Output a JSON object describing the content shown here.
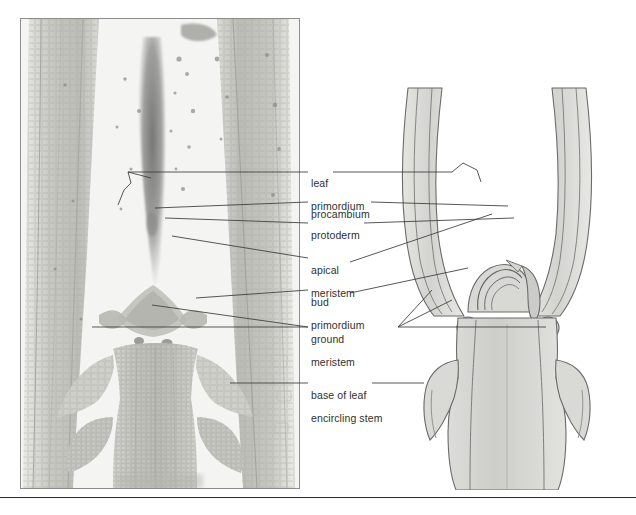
{
  "figure": {
    "panels": {
      "micrograph": {
        "name": "light micrograph of shoot apex",
        "kind": "photomicrograph",
        "tone": "grayscale"
      },
      "drawing": {
        "name": "interpretive line drawing of shoot apex",
        "kind": "line-drawing",
        "tone": "grayscale"
      }
    }
  },
  "labels": [
    {
      "id": "leaf-primordium",
      "line1": "leaf",
      "line2": "primordium"
    },
    {
      "id": "procambium",
      "line1": "procambium",
      "line2": ""
    },
    {
      "id": "protoderm",
      "line1": "protoderm",
      "line2": ""
    },
    {
      "id": "apical-meristem",
      "line1": "apical",
      "line2": "meristem"
    },
    {
      "id": "bud-primordium",
      "line1": "bud",
      "line2": "primordium"
    },
    {
      "id": "ground-meristem",
      "line1": "ground",
      "line2": "meristem"
    },
    {
      "id": "base-of-leaf",
      "line1": "base of leaf",
      "line2": "encircling stem"
    }
  ],
  "colors": {
    "leader": "#3a3a3a",
    "text": "#2f2f2f",
    "panel_border": "#8d8d8d",
    "rule": "#2a2a2a",
    "tissue_light": "#dcdcd8",
    "tissue_mid": "#c2c2bd",
    "tissue_dark": "#9a9a95",
    "stain_dark": "#7c7c7a",
    "paper": "#ffffff"
  },
  "caption": {
    "text": ""
  }
}
